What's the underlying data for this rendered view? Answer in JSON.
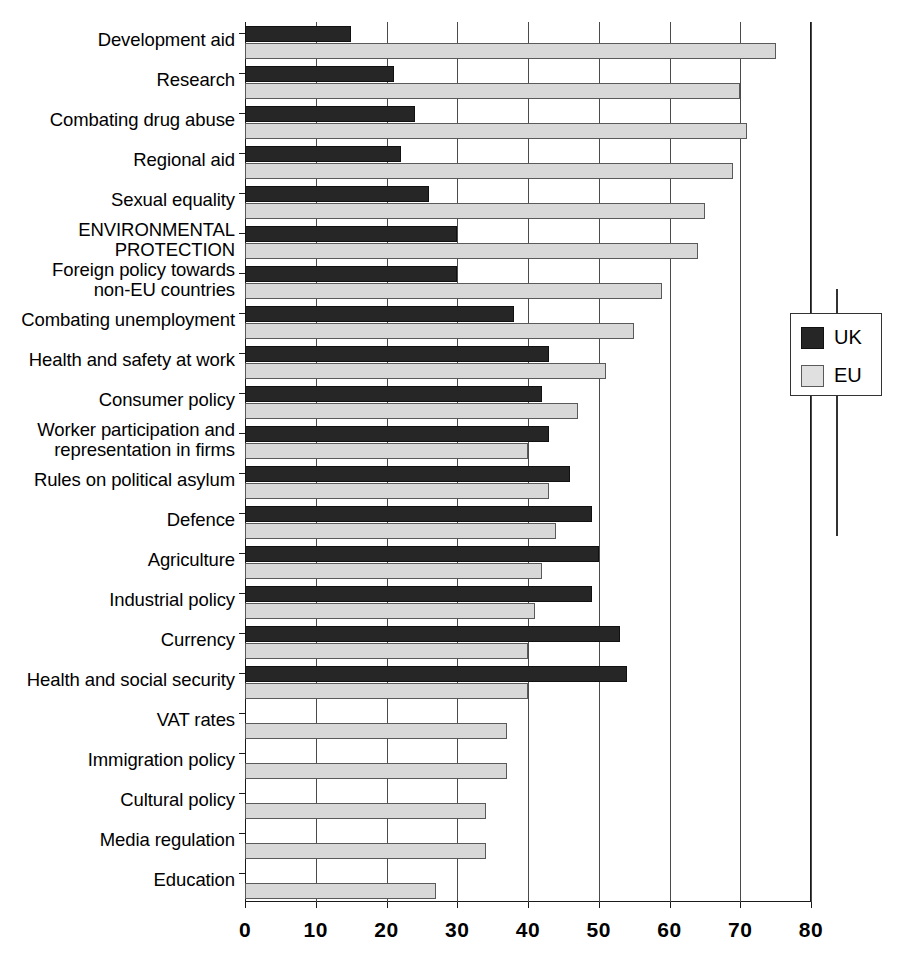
{
  "chart_data": {
    "type": "bar",
    "orientation": "horizontal",
    "title": "",
    "xlabel": "",
    "ylabel": "",
    "xlim": [
      0,
      80
    ],
    "xticks": [
      0,
      10,
      20,
      30,
      40,
      50,
      60,
      70,
      80
    ],
    "xtick_labels": [
      "0",
      "10",
      "20",
      "30",
      "40",
      "50",
      "60",
      "70",
      "80"
    ],
    "grid": true,
    "legend_position": "right",
    "colors": {
      "uk": "#262626",
      "eu": "#d8d8d8",
      "axis": "#1a1a1a"
    },
    "categories": [
      "Development aid",
      "Research",
      "Combating drug abuse",
      "Regional aid",
      "Sexual equality",
      "ENVIRONMENTAL PROTECTION",
      "Foreign policy towards non-EU countries",
      "Combating unemployment",
      "Health and safety at work",
      "Consumer policy",
      "Worker participation and representation in firms",
      "Rules on political asylum",
      "Defence",
      "Agriculture",
      "Industrial policy",
      "Currency",
      "Health and social security",
      "VAT rates",
      "Immigration policy",
      "Cultural policy",
      "Media regulation",
      "Education"
    ],
    "series": [
      {
        "name": "UK",
        "values": [
          15,
          21,
          24,
          22,
          26,
          30,
          30,
          38,
          43,
          42,
          43,
          46,
          49,
          50,
          49,
          53,
          54,
          null,
          null,
          null,
          null,
          null
        ]
      },
      {
        "name": "EU",
        "values": [
          75,
          70,
          71,
          69,
          65,
          64,
          59,
          55,
          51,
          47,
          40,
          43,
          44,
          42,
          41,
          40,
          40,
          37,
          37,
          34,
          34,
          27
        ]
      }
    ]
  },
  "categories_display": [
    {
      "lines": [
        "Development aid"
      ],
      "caps": false
    },
    {
      "lines": [
        "Research"
      ],
      "caps": false
    },
    {
      "lines": [
        "Combating drug abuse"
      ],
      "caps": false
    },
    {
      "lines": [
        "Regional aid"
      ],
      "caps": false
    },
    {
      "lines": [
        "Sexual equality"
      ],
      "caps": false
    },
    {
      "lines": [
        "ENVIRONMENTAL",
        "PROTECTION"
      ],
      "caps": true
    },
    {
      "lines": [
        "Foreign policy towards",
        "non-EU countries"
      ],
      "caps": false
    },
    {
      "lines": [
        "Combating unemployment"
      ],
      "caps": false
    },
    {
      "lines": [
        "Health and safety at work"
      ],
      "caps": false
    },
    {
      "lines": [
        "Consumer policy"
      ],
      "caps": false
    },
    {
      "lines": [
        "Worker participation and",
        "representation in firms"
      ],
      "caps": false
    },
    {
      "lines": [
        "Rules on political asylum"
      ],
      "caps": false
    },
    {
      "lines": [
        "Defence"
      ],
      "caps": false
    },
    {
      "lines": [
        "Agriculture"
      ],
      "caps": false
    },
    {
      "lines": [
        "Industrial policy"
      ],
      "caps": false
    },
    {
      "lines": [
        "Currency"
      ],
      "caps": false
    },
    {
      "lines": [
        "Health and social security"
      ],
      "caps": false
    },
    {
      "lines": [
        "VAT rates"
      ],
      "caps": false
    },
    {
      "lines": [
        "Immigration policy"
      ],
      "caps": false
    },
    {
      "lines": [
        "Cultural policy"
      ],
      "caps": false
    },
    {
      "lines": [
        "Media regulation"
      ],
      "caps": false
    },
    {
      "lines": [
        "Education"
      ],
      "caps": false
    }
  ],
  "legend": {
    "items": [
      {
        "label": "UK",
        "key": "uk"
      },
      {
        "label": "EU",
        "key": "eu"
      }
    ]
  }
}
